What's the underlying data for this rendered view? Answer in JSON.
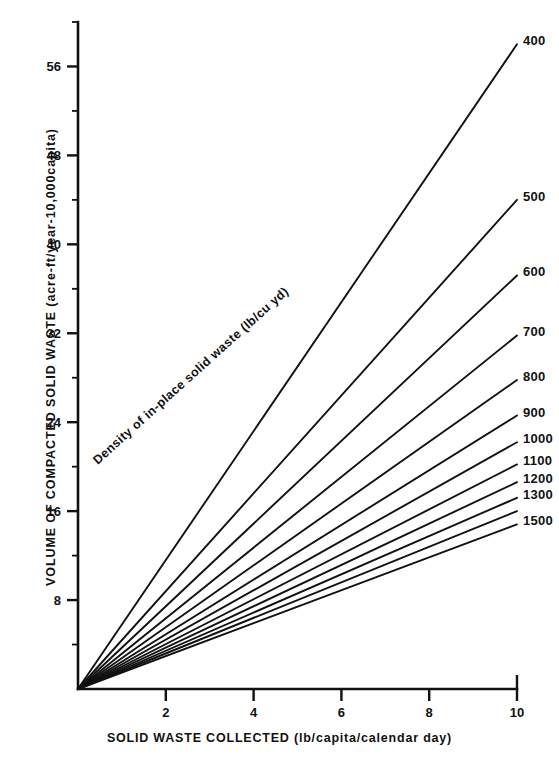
{
  "chart_data": {
    "type": "line",
    "title": "",
    "xlabel": "SOLID WASTE COLLECTED (lb/capita/calendar day)",
    "ylabel": "VOLUME OF COMPACTED SOLID WASTE (acre-ft/year-10,000capita)",
    "xlim": [
      0,
      10
    ],
    "ylim": [
      0,
      60
    ],
    "xticks": [
      2,
      4,
      6,
      8,
      10
    ],
    "xtick_labels": [
      "2",
      "4",
      "6",
      "8",
      "10"
    ],
    "yticks": [
      8,
      16,
      24,
      32,
      40,
      48,
      56
    ],
    "ytick_labels": [
      "8",
      "16",
      "24",
      "32",
      "40",
      "48",
      "56"
    ],
    "grid": false,
    "legend_position": "right-of-line-ends",
    "annotations": [
      {
        "text": "Density of in-place solid waste (lb/cu yd)",
        "x": 2.0,
        "y": 14.0,
        "rotation": -42
      }
    ],
    "series_label_header": "Density of in-place solid waste (lb/cu yd)",
    "series": [
      {
        "name": "400",
        "label": "400",
        "density_lb_per_cu_yd": 400,
        "slope": 5.8,
        "x": [
          0,
          10
        ],
        "values": [
          0,
          58.0
        ]
      },
      {
        "name": "500",
        "label": "500",
        "density_lb_per_cu_yd": 500,
        "slope": 4.4,
        "x": [
          0,
          10
        ],
        "values": [
          0,
          44.0
        ]
      },
      {
        "name": "600",
        "label": "600",
        "density_lb_per_cu_yd": 600,
        "slope": 3.72,
        "x": [
          0,
          10
        ],
        "values": [
          0,
          37.2
        ]
      },
      {
        "name": "700",
        "label": "700",
        "density_lb_per_cu_yd": 700,
        "slope": 3.18,
        "x": [
          0,
          10
        ],
        "values": [
          0,
          31.8
        ]
      },
      {
        "name": "800",
        "label": "800",
        "density_lb_per_cu_yd": 800,
        "slope": 2.78,
        "x": [
          0,
          10
        ],
        "values": [
          0,
          27.8
        ]
      },
      {
        "name": "900",
        "label": "900",
        "density_lb_per_cu_yd": 900,
        "slope": 2.46,
        "x": [
          0,
          10
        ],
        "values": [
          0,
          24.6
        ]
      },
      {
        "name": "1000",
        "label": "1000",
        "density_lb_per_cu_yd": 1000,
        "slope": 2.22,
        "x": [
          0,
          10
        ],
        "values": [
          0,
          22.2
        ]
      },
      {
        "name": "1100",
        "label": "1100",
        "density_lb_per_cu_yd": 1100,
        "slope": 2.02,
        "x": [
          0,
          10
        ],
        "values": [
          0,
          20.2
        ]
      },
      {
        "name": "1200",
        "label": "1200",
        "density_lb_per_cu_yd": 1200,
        "slope": 1.86,
        "x": [
          0,
          10
        ],
        "values": [
          0,
          18.6
        ]
      },
      {
        "name": "1300",
        "label": "1300",
        "density_lb_per_cu_yd": 1300,
        "slope": 1.72,
        "x": [
          0,
          10
        ],
        "values": [
          0,
          17.2
        ]
      },
      {
        "name": "1400",
        "label": "",
        "density_lb_per_cu_yd": 1400,
        "slope": 1.6,
        "x": [
          0,
          10
        ],
        "values": [
          0,
          16.0
        ]
      },
      {
        "name": "1500",
        "label": "1500",
        "density_lb_per_cu_yd": 1500,
        "slope": 1.48,
        "x": [
          0,
          10
        ],
        "values": [
          0,
          14.8
        ]
      }
    ]
  }
}
